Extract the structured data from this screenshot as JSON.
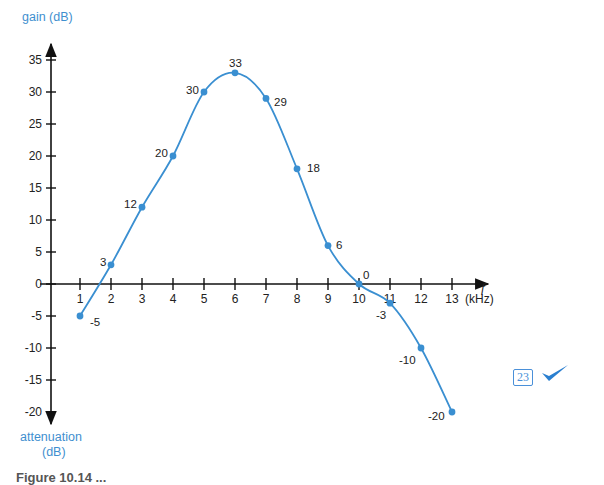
{
  "chart_data": {
    "type": "line",
    "title": "",
    "xlabel": "f (kHz)",
    "ylabel_top": "gain (dB)",
    "ylabel_bottom": "attenuation (dB)",
    "x": [
      1,
      2,
      3,
      4,
      5,
      6,
      7,
      8,
      9,
      10,
      11,
      12,
      13
    ],
    "values": [
      -5,
      3,
      12,
      20,
      30,
      33,
      29,
      18,
      6,
      0,
      -3,
      -10,
      -20
    ],
    "series": [
      {
        "name": "gain",
        "values": [
          -5,
          3,
          12,
          20,
          30,
          33,
          29,
          18,
          6,
          0,
          -3,
          -10,
          -20
        ]
      }
    ],
    "xlim": [
      0,
      14
    ],
    "ylim": [
      -20,
      35
    ],
    "x_ticks": [
      "1",
      "2",
      "3",
      "4",
      "5",
      "6",
      "7",
      "8",
      "9",
      "10",
      "11",
      "12",
      "13"
    ],
    "y_ticks": [
      "35",
      "30",
      "25",
      "20",
      "15",
      "10",
      "5",
      "0",
      "-5",
      "-10",
      "-15",
      "-20"
    ],
    "point_labels": [
      "-5",
      "3",
      "12",
      "20",
      "30",
      "33",
      "29",
      "18",
      "6",
      "0",
      "-3",
      "-10",
      "-20"
    ],
    "grid": false,
    "legend": null,
    "line_color": "#3a8fd1"
  },
  "axes": {
    "y_title": "gain (dB)",
    "y_bottom_title_line1": "attenuation",
    "y_bottom_title_line2": "(dB)",
    "x_symbol": "f",
    "x_unit": "(kHz)"
  },
  "caption": "Figure 10.14 ...",
  "badge": {
    "number": "23"
  }
}
